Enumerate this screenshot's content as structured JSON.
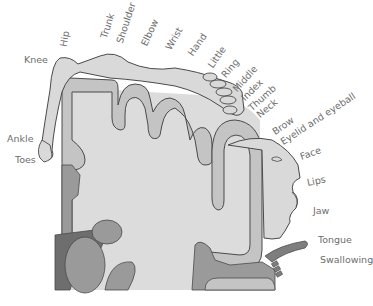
{
  "diagram": {
    "colors": {
      "white_matter": "#dcdcdc",
      "cortex_light": "#c4c4c4",
      "cortex_dark": "#9a9a9a",
      "deep_nuclei": "#8c8c8c",
      "body_figure": "#d9d9d9",
      "outline": "#4a4a4a",
      "label": "#6d6d6d"
    },
    "labels": {
      "knee": "Knee",
      "hip": "Hip",
      "trunk": "Trunk",
      "shoulder": "Shoulder",
      "elbow": "Elbow",
      "wrist": "Wrist",
      "hand": "Hand",
      "little": "Little",
      "ring": "Ring",
      "middle": "Middle",
      "index": "Index",
      "thumb": "Thumb",
      "neck": "Neck",
      "brow": "Brow",
      "eyelid": "Eyelid and eyeball",
      "face": "Face",
      "lips": "Lips",
      "jaw": "Jaw",
      "tongue": "Tongue",
      "swallowing": "Swallowing",
      "ankle": "Ankle",
      "toes": "Toes"
    }
  }
}
